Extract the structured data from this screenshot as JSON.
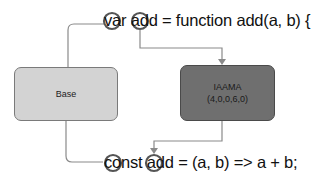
{
  "diagram": {
    "top_code": "var add = function add(a, b) {",
    "bottom_code": "const add = (a, b) => a + b;",
    "nodes": [
      {
        "id": "base",
        "label": "Base",
        "fill": "#d3d3d3"
      },
      {
        "id": "iaama",
        "label": "IAAMA",
        "sublabel": "(4,0,0,6,0)",
        "fill": "#6f6f6f"
      }
    ],
    "highlights": [
      {
        "line": "top",
        "token": "var"
      },
      {
        "line": "top",
        "token": "add"
      },
      {
        "line": "bottom",
        "token": "const"
      },
      {
        "line": "bottom",
        "token": "add"
      }
    ],
    "edges": [
      {
        "from": "top.var",
        "to": "base",
        "arrow": false
      },
      {
        "from": "top.add",
        "to": "iaama",
        "arrow": true
      },
      {
        "from": "base",
        "to": "bottom.const",
        "arrow": false
      },
      {
        "from": "iaama",
        "to": "bottom.add",
        "arrow": true
      }
    ],
    "colors": {
      "line": "#8a8a8a",
      "circle": "#555555",
      "text": "#111111"
    }
  }
}
